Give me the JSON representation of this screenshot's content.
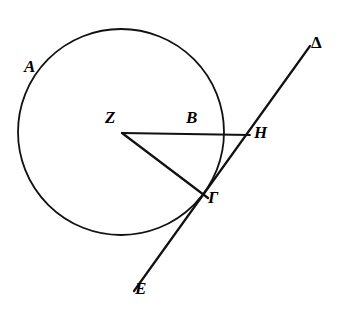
{
  "figure": {
    "kind": "euclidean-geometry-diagram",
    "canvas": {
      "width": 346,
      "height": 322,
      "background": "#ffffff"
    },
    "stroke_color": "#111111",
    "circle": {
      "name": "main-circle",
      "center_x": 121,
      "center_y": 132,
      "radius": 103,
      "stroke_width": 1.8
    },
    "segments": [
      {
        "name": "segment-ZH",
        "from_label": "Z",
        "to_label": "H",
        "x1": 122,
        "y1": 133,
        "x2": 250,
        "y2": 135,
        "stroke_width": 1.8
      },
      {
        "name": "segment-ZG",
        "from_label": "Z",
        "to_label": "Γ",
        "x1": 122,
        "y1": 133,
        "x2": 208,
        "y2": 198,
        "stroke_width": 2.2
      },
      {
        "name": "line-E-to-Delta",
        "from_label": "E",
        "to_label": "Δ",
        "x1": 134,
        "y1": 291,
        "x2": 310,
        "y2": 46,
        "stroke_width": 2.2
      }
    ],
    "labels": [
      {
        "id": "A",
        "text": "A",
        "x": 24,
        "y": 58,
        "on": "circle-arc-upper-left"
      },
      {
        "id": "Z",
        "text": "Z",
        "x": 105,
        "y": 109,
        "on": "circle-center"
      },
      {
        "id": "B",
        "text": "B",
        "x": 186,
        "y": 109,
        "on": "segment-ZH-midpoint"
      },
      {
        "id": "H",
        "text": "H",
        "x": 254,
        "y": 124,
        "on": "segment-ZH-endpoint"
      },
      {
        "id": "G",
        "text": "Γ",
        "x": 208,
        "y": 189,
        "on": "circle-point-of-contact"
      },
      {
        "id": "D",
        "text": "Δ",
        "x": 311,
        "y": 34,
        "on": "line-upper-endpoint"
      },
      {
        "id": "E",
        "text": "E",
        "x": 135,
        "y": 280,
        "on": "line-lower-endpoint"
      }
    ]
  }
}
